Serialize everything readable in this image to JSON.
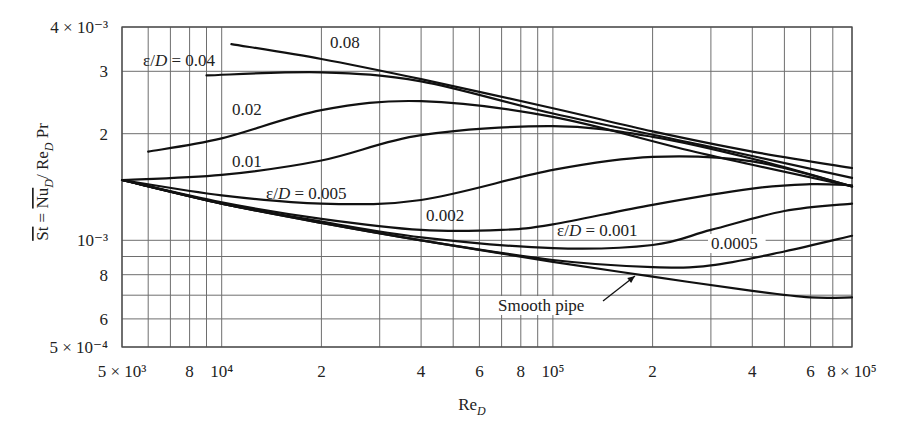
{
  "chart_data": {
    "type": "line",
    "title": "",
    "xlabel": "Re_D",
    "ylabel": "St = Nu_D / Re_D Pr",
    "xscale": "log",
    "yscale": "log",
    "xlim": [
      5000,
      800000
    ],
    "ylim": [
      0.0005,
      0.004
    ],
    "grid": true,
    "legend": "none (curves labeled inline by ε/D)",
    "x_tick_labels": [
      {
        "value": 5000,
        "label": "5 × 10³"
      },
      {
        "value": 8000,
        "label": "8"
      },
      {
        "value": 10000,
        "label": "10⁴"
      },
      {
        "value": 20000,
        "label": "2"
      },
      {
        "value": 40000,
        "label": "4"
      },
      {
        "value": 60000,
        "label": "6"
      },
      {
        "value": 80000,
        "label": "8"
      },
      {
        "value": 100000,
        "label": "10⁵"
      },
      {
        "value": 200000,
        "label": "2"
      },
      {
        "value": 400000,
        "label": "4"
      },
      {
        "value": 600000,
        "label": "6"
      },
      {
        "value": 800000,
        "label": "8 × 10⁵"
      }
    ],
    "y_tick_labels": [
      {
        "value": 0.004,
        "label": "4 × 10⁻³"
      },
      {
        "value": 0.003,
        "label": "3"
      },
      {
        "value": 0.002,
        "label": "2"
      },
      {
        "value": 0.001,
        "label": "10⁻³"
      },
      {
        "value": 0.0008,
        "label": "8"
      },
      {
        "value": 0.0006,
        "label": "6"
      },
      {
        "value": 0.0005,
        "label": "5 × 10⁻⁴"
      }
    ],
    "x_gridlines": [
      5000,
      6000,
      7000,
      8000,
      9000,
      10000,
      20000,
      30000,
      40000,
      50000,
      60000,
      70000,
      80000,
      90000,
      100000,
      200000,
      300000,
      400000,
      500000,
      600000,
      700000,
      800000
    ],
    "y_gridlines": [
      0.0005,
      0.0006,
      0.0007,
      0.0008,
      0.0009,
      0.001,
      0.002,
      0.003,
      0.004
    ],
    "series": [
      {
        "name": "ε/D = 0.08",
        "label": "0.08",
        "points": [
          [
            10700,
            0.00358
          ],
          [
            20000,
            0.00325
          ],
          [
            40000,
            0.00285
          ],
          [
            100000,
            0.00236
          ],
          [
            200000,
            0.00203
          ],
          [
            400000,
            0.00178
          ],
          [
            800000,
            0.0016
          ]
        ]
      },
      {
        "name": "ε/D = 0.04",
        "label": "ε/D = 0.04",
        "points": [
          [
            9000,
            0.00292
          ],
          [
            20000,
            0.00298
          ],
          [
            40000,
            0.00281
          ],
          [
            100000,
            0.00228
          ],
          [
            280000,
            0.00186
          ],
          [
            800000,
            0.0015
          ]
        ]
      },
      {
        "name": "ε/D = 0.02",
        "label": "0.02",
        "points": [
          [
            6000,
            0.00178
          ],
          [
            10000,
            0.00194
          ],
          [
            20000,
            0.00233
          ],
          [
            40000,
            0.00247
          ],
          [
            100000,
            0.00223
          ],
          [
            280000,
            0.00176
          ],
          [
            800000,
            0.00142
          ]
        ]
      },
      {
        "name": "ε/D = 0.01",
        "label": "0.01",
        "points": [
          [
            5000,
            0.00148
          ],
          [
            10000,
            0.00153
          ],
          [
            20000,
            0.00168
          ],
          [
            40000,
            0.00198
          ],
          [
            100000,
            0.0021
          ],
          [
            200000,
            0.00196
          ],
          [
            400000,
            0.0017
          ],
          [
            800000,
            0.00142
          ]
        ]
      },
      {
        "name": "ε/D = 0.005",
        "label": "ε/D = 0.005",
        "points": [
          [
            5000,
            0.00148
          ],
          [
            10000,
            0.00134
          ],
          [
            20000,
            0.00127
          ],
          [
            40000,
            0.0013
          ],
          [
            100000,
            0.00158
          ],
          [
            200000,
            0.00172
          ],
          [
            400000,
            0.00167
          ],
          [
            800000,
            0.00142
          ]
        ]
      },
      {
        "name": "ε/D = 0.002",
        "label": "0.002",
        "points": [
          [
            5000,
            0.00148
          ],
          [
            10000,
            0.00128
          ],
          [
            20000,
            0.00115
          ],
          [
            40000,
            0.00107
          ],
          [
            70000,
            0.00107
          ],
          [
            100000,
            0.00111
          ],
          [
            200000,
            0.00126
          ],
          [
            400000,
            0.0014
          ],
          [
            600000,
            0.00144
          ],
          [
            800000,
            0.00143
          ]
        ]
      },
      {
        "name": "ε/D = 0.001",
        "label": "ε/D = 0.001",
        "points": [
          [
            5000,
            0.00148
          ],
          [
            10000,
            0.00127
          ],
          [
            20000,
            0.00113
          ],
          [
            40000,
            0.00102
          ],
          [
            100000,
            0.00095
          ],
          [
            200000,
            0.00097
          ],
          [
            300000,
            0.00107
          ],
          [
            500000,
            0.00121
          ],
          [
            800000,
            0.00127
          ]
        ]
      },
      {
        "name": "ε/D = 0.0005",
        "label": "0.0005",
        "points": [
          [
            5000,
            0.00148
          ],
          [
            10000,
            0.00127
          ],
          [
            20000,
            0.00112
          ],
          [
            40000,
            0.001
          ],
          [
            100000,
            0.00088
          ],
          [
            200000,
            0.00084
          ],
          [
            300000,
            0.00085
          ],
          [
            500000,
            0.00093
          ],
          [
            800000,
            0.00103
          ]
        ]
      },
      {
        "name": "Smooth pipe",
        "label": "Smooth pipe",
        "points": [
          [
            5000,
            0.00148
          ],
          [
            10000,
            0.00127
          ],
          [
            20000,
            0.00112
          ],
          [
            40000,
            0.001
          ],
          [
            100000,
            0.00087
          ],
          [
            200000,
            0.00079
          ],
          [
            400000,
            0.00072
          ],
          [
            600000,
            0.00069
          ],
          [
            800000,
            0.00069
          ]
        ]
      }
    ]
  },
  "annotations": {
    "curve_labels": [
      {
        "id": "label-008",
        "text": "0.08",
        "x": 330,
        "y": 48
      },
      {
        "id": "label-004",
        "text": "ε/D = 0.04",
        "x": 143,
        "y": 66
      },
      {
        "id": "label-002",
        "text": "0.02",
        "x": 232,
        "y": 115
      },
      {
        "id": "label-001",
        "text": "0.01",
        "x": 232,
        "y": 167
      },
      {
        "id": "label-0005",
        "text": "ε/D = 0.005",
        "x": 266,
        "y": 199
      },
      {
        "id": "label-0002",
        "text": "0.002",
        "x": 426,
        "y": 221
      },
      {
        "id": "label-00010",
        "text": "ε/D = 0.001",
        "x": 557,
        "y": 236
      },
      {
        "id": "label-000005",
        "text": "0.0005",
        "x": 711,
        "y": 249
      },
      {
        "id": "label-smooth",
        "text": "Smooth pipe",
        "x": 498,
        "y": 311
      }
    ],
    "smooth_arrow": {
      "from": [
        603,
        301
      ],
      "to": [
        635,
        276
      ]
    }
  }
}
